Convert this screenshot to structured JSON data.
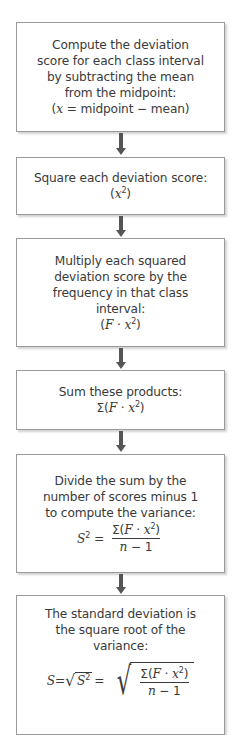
{
  "diagram": {
    "type": "flowchart",
    "direction": "top-to-bottom",
    "colors": {
      "box_border": "#9a9a9a",
      "box_fill": "#ffffff",
      "arrow": "#555555",
      "text": "#3a3a3a"
    },
    "steps": [
      {
        "id": "step-1",
        "lines": [
          "Compute the deviation",
          "score for each class interval",
          "by subtracting the mean",
          "from the midpoint:"
        ],
        "formula": {
          "open": "(",
          "var": "x",
          "rest": " = midpoint − mean)"
        }
      },
      {
        "id": "step-2",
        "lines": [
          "Square each deviation score:"
        ],
        "formula": {
          "open": "(",
          "var": "x",
          "sup": "2",
          "close": ")"
        }
      },
      {
        "id": "step-3",
        "lines": [
          "Multiply each squared",
          "deviation score by the",
          "frequency in that class",
          "interval:"
        ],
        "formula": {
          "open": "(",
          "var_f": "F",
          "dot": " · ",
          "var": "x",
          "sup": "2",
          "close": ")"
        }
      },
      {
        "id": "step-4",
        "lines": [
          "Sum these products:"
        ],
        "formula": {
          "open": "Σ(",
          "var_f": "F",
          "dot": " · ",
          "var": "x",
          "sup": "2",
          "close": ")"
        }
      },
      {
        "id": "step-5",
        "lines": [
          "Divide the sum by the",
          "number of scores minus 1",
          "to compute the variance:"
        ],
        "formula": {
          "lhs_var": "S",
          "lhs_sup": "2",
          "eq": " =",
          "num_open": "Σ(",
          "num_f": "F",
          "num_dot": " · ",
          "num_x": "x",
          "num_sup": "2",
          "num_close": ")",
          "den_n": "n",
          "den_rest": " − 1"
        }
      },
      {
        "id": "step-6",
        "lines": [
          "The standard deviation is",
          "the square root of the",
          "variance:"
        ],
        "formula": {
          "lhs": "S",
          "eq1": "=",
          "rad": "√",
          "inner_var": "S",
          "inner_sup": "2",
          "eq2": " =",
          "num_open": "Σ(",
          "num_f": "F",
          "num_dot": " · ",
          "num_x": "x",
          "num_sup": "2",
          "num_close": ")",
          "den_n": "n",
          "den_rest": " − 1"
        }
      }
    ]
  }
}
